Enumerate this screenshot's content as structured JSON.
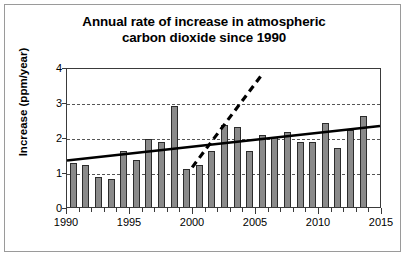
{
  "chart_data": {
    "type": "bar",
    "title": "Annual rate of increase in atmospheric carbon dioxide since 1990",
    "title_line1": "Annual rate of increase in atmospheric",
    "title_line2": "carbon dioxide since 1990",
    "xlabel": "",
    "ylabel": "Increase  (ppm/year)",
    "xlim": [
      1990,
      2015
    ],
    "ylim": [
      0,
      4
    ],
    "yticks": [
      0,
      1,
      2,
      3,
      4
    ],
    "ytick_labels": [
      "0",
      "1",
      "2",
      "3",
      "4"
    ],
    "xticks": [
      1990,
      1995,
      2000,
      2005,
      2010,
      2015
    ],
    "xtick_labels": [
      "1990",
      "1995",
      "2000",
      "2005",
      "2010",
      "2015"
    ],
    "x_minor_tick_interval": 1,
    "gridlines": [
      1,
      2,
      3
    ],
    "grid": "horizontal-dashed",
    "legend": "none",
    "bar_color": "#8a8a8a",
    "bar_edge_color": "#2b2b2b",
    "line_color": "#000000",
    "categories": [
      1990,
      1991,
      1992,
      1993,
      1994,
      1995,
      1996,
      1997,
      1998,
      1999,
      2000,
      2001,
      2002,
      2003,
      2004,
      2005,
      2006,
      2007,
      2008,
      2009,
      2010,
      2011,
      2012,
      2013
    ],
    "values": [
      1.25,
      1.2,
      0.85,
      0.8,
      1.6,
      1.35,
      1.95,
      1.85,
      2.9,
      1.1,
      1.2,
      1.6,
      2.35,
      2.3,
      1.6,
      2.05,
      2.0,
      2.15,
      1.85,
      1.85,
      2.4,
      1.7,
      2.2,
      2.6
    ],
    "series": [
      {
        "name": "Annual increase",
        "type": "bar",
        "values": [
          1.25,
          1.2,
          0.85,
          0.8,
          1.6,
          1.35,
          1.95,
          1.85,
          2.9,
          1.1,
          1.2,
          1.6,
          2.35,
          2.3,
          1.6,
          2.05,
          2.0,
          2.15,
          1.85,
          1.85,
          2.4,
          1.7,
          2.2,
          2.6
        ]
      },
      {
        "name": "Long-term trend line",
        "type": "line",
        "style": "solid",
        "points": [
          [
            1990,
            1.35
          ],
          [
            2015,
            2.35
          ]
        ]
      },
      {
        "name": "Steep short-term trend line",
        "type": "line",
        "style": "dashed",
        "points": [
          [
            2000,
            1.15
          ],
          [
            2005.7,
            3.9
          ]
        ]
      }
    ]
  }
}
